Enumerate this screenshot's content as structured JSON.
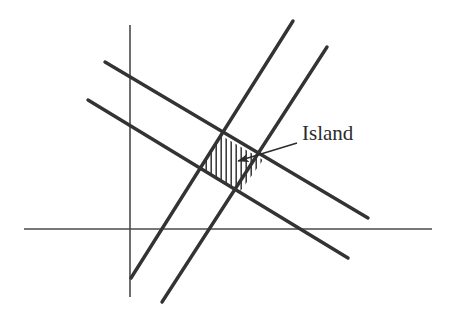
{
  "figure": {
    "name": "island-diagram",
    "background": "#ffffff",
    "stroke_color": "#333333",
    "axis_color": "#4a4a4a",
    "hatch_color": "#333333",
    "width": 451,
    "height": 320
  },
  "labels": {
    "island": "Island"
  },
  "label_positions": {
    "island": {
      "x": 302,
      "y": 121,
      "font_size": 21
    }
  },
  "chart_data": {
    "type": "diagram",
    "title": "",
    "xlabel": "",
    "ylabel": "",
    "axes": [
      {
        "name": "x-axis",
        "orientation": "horizontal",
        "x1": 24,
        "y1": 229,
        "x2": 432,
        "y2": 229,
        "width": 1.6
      },
      {
        "name": "y-axis",
        "orientation": "vertical",
        "x1": 130,
        "y1": 25,
        "x2": 130,
        "y2": 297,
        "width": 1.6
      }
    ],
    "lines": [
      {
        "name": "descending-line-upper",
        "x1": 105,
        "y1": 62,
        "x2": 368,
        "y2": 218,
        "slope": -0.593,
        "width": 3.4
      },
      {
        "name": "descending-line-lower",
        "x1": 88,
        "y1": 100,
        "x2": 348,
        "y2": 258,
        "slope": -0.608,
        "width": 3.4
      },
      {
        "name": "ascending-line-left",
        "x1": 131,
        "y1": 278,
        "x2": 293,
        "y2": 21,
        "slope": -1.586,
        "width": 3.4
      },
      {
        "name": "ascending-line-right",
        "x1": 162,
        "y1": 302,
        "x2": 327,
        "y2": 47,
        "slope": -1.545,
        "width": 3.4
      }
    ],
    "island_polygon": {
      "name": "island-region",
      "points": [
        [
          222,
          136
        ],
        [
          263,
          160
        ],
        [
          239,
          193
        ],
        [
          199,
          169
        ]
      ],
      "fill": "hatched-vertical",
      "hatch_spacing": 5,
      "hatch_angle_deg": 90
    },
    "annotation_arrow": {
      "name": "island-leader",
      "from_x": 297,
      "from_y": 143,
      "to_x": 238,
      "to_y": 161,
      "head_length": 11,
      "width": 1.4
    },
    "grid": false,
    "legend": null
  }
}
